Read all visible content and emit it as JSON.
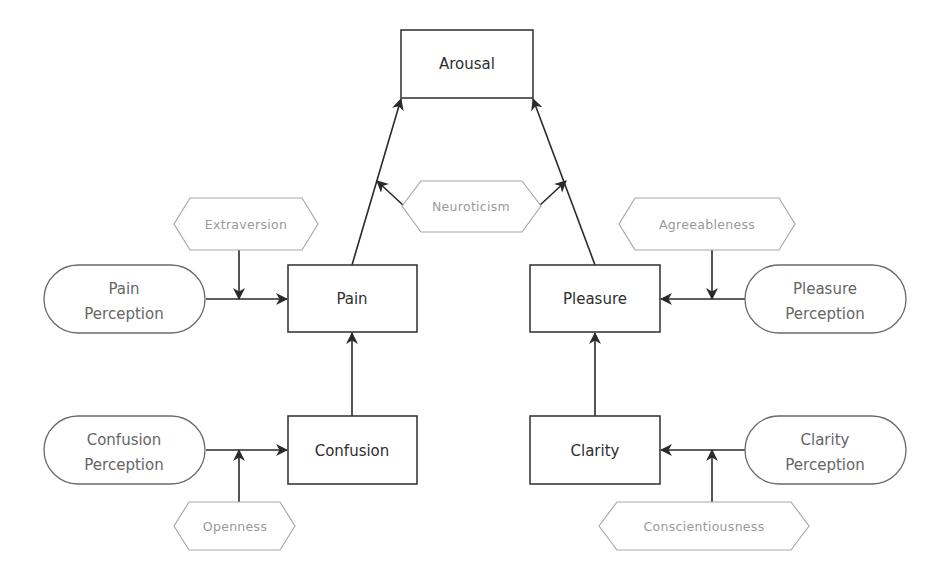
{
  "diagram": {
    "colors": {
      "background": "#ffffff",
      "construct_stroke": "#3a3a3a",
      "construct_text": "#2e2e2e",
      "perception_stroke": "#6a6a6a",
      "perception_text": "#666666",
      "moderator_stroke": "#a8a8a8",
      "moderator_text": "#9a9a9a",
      "edge": "#2a2a2a"
    },
    "constructs": {
      "arousal": "Arousal",
      "pain": "Pain",
      "pleasure": "Pleasure",
      "confusion": "Confusion",
      "clarity": "Clarity"
    },
    "perceptions": {
      "pain": [
        "Pain",
        "Perception"
      ],
      "pleasure": [
        "Pleasure",
        "Perception"
      ],
      "confusion": [
        "Confusion",
        "Perception"
      ],
      "clarity": [
        "Clarity",
        "Perception"
      ]
    },
    "moderators": {
      "extraversion": "Extraversion",
      "agreeableness": "Agreeableness",
      "neuroticism": "Neuroticism",
      "openness": "Openness",
      "conscientiousness": "Conscientiousness"
    },
    "edges": [
      {
        "from": "Pain Perception",
        "to": "Pain",
        "moderator": "Extraversion"
      },
      {
        "from": "Pleasure Perception",
        "to": "Pleasure",
        "moderator": "Agreeableness"
      },
      {
        "from": "Confusion Perception",
        "to": "Confusion",
        "moderator": "Openness"
      },
      {
        "from": "Clarity Perception",
        "to": "Clarity",
        "moderator": "Conscientiousness"
      },
      {
        "from": "Confusion",
        "to": "Pain"
      },
      {
        "from": "Clarity",
        "to": "Pleasure"
      },
      {
        "from": "Pain",
        "to": "Arousal",
        "moderator": "Neuroticism"
      },
      {
        "from": "Pleasure",
        "to": "Arousal",
        "moderator": "Neuroticism"
      }
    ]
  }
}
